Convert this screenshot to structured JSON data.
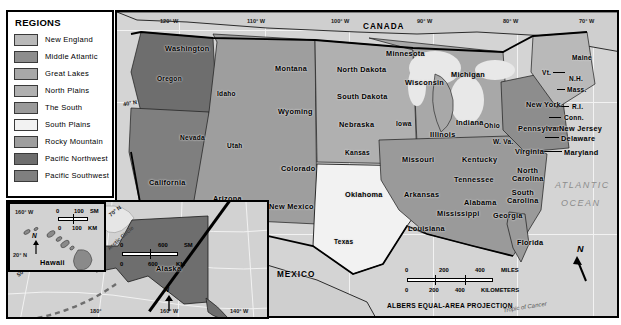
{
  "legend": {
    "title": "REGIONS",
    "items": [
      {
        "label": "New England",
        "color": "#b9b9b9"
      },
      {
        "label": "Middle Atlantic",
        "color": "#8d8d8d"
      },
      {
        "label": "Great Lakes",
        "color": "#a8a8a8"
      },
      {
        "label": "North Plains",
        "color": "#b0b0b0"
      },
      {
        "label": "The South",
        "color": "#9a9a9a"
      },
      {
        "label": "South Plains",
        "color": "#f2f2f2"
      },
      {
        "label": "Rocky Mountain",
        "color": "#9e9e9e"
      },
      {
        "label": "Pacific Northwest",
        "color": "#6e6e6e"
      },
      {
        "label": "Pacific Southwest",
        "color": "#7f7f7f"
      }
    ]
  },
  "map": {
    "countries": [
      "CANADA",
      "MEXICO"
    ],
    "ocean_label_line1": "ATLANTIC",
    "ocean_label_line2": "OCEAN",
    "longitudes": [
      "120° W",
      "110° W",
      "100° W",
      "90° W",
      "80° W",
      "70° W"
    ],
    "latitudes": [
      "40° N",
      "30° N"
    ],
    "tropic_label": "Tropic of Cancer",
    "projection": "ALBERS EQUAL-AREA PROJECTION",
    "compass": "N",
    "scale": {
      "miles_label": "MILES",
      "miles_ticks": [
        "0",
        "200",
        "400"
      ],
      "km_label": "KILOMETERS",
      "km_ticks": [
        "0",
        "200",
        "400"
      ]
    },
    "states": [
      {
        "name": "Washington",
        "x": 48,
        "y": 32,
        "region": "Pacific Northwest"
      },
      {
        "name": "Oregon",
        "x": 40,
        "y": 63,
        "region": "Pacific Northwest"
      },
      {
        "name": "Idaho",
        "x": 100,
        "y": 78,
        "region": "Rocky Mountain"
      },
      {
        "name": "Montana",
        "x": 158,
        "y": 52,
        "region": "Rocky Mountain"
      },
      {
        "name": "Wyoming",
        "x": 161,
        "y": 95,
        "region": "Rocky Mountain"
      },
      {
        "name": "Nevada",
        "x": 63,
        "y": 122,
        "region": "Pacific Southwest"
      },
      {
        "name": "Utah",
        "x": 110,
        "y": 130,
        "region": "Rocky Mountain"
      },
      {
        "name": "Colorado",
        "x": 164,
        "y": 152,
        "region": "Rocky Mountain"
      },
      {
        "name": "California",
        "x": 32,
        "y": 166,
        "region": "Pacific Southwest"
      },
      {
        "name": "Arizona",
        "x": 96,
        "y": 182,
        "region": "Rocky Mountain"
      },
      {
        "name": "New Mexico",
        "x": 152,
        "y": 190,
        "region": "Rocky Mountain"
      },
      {
        "name": "North Dakota",
        "x": 220,
        "y": 53,
        "region": "North Plains"
      },
      {
        "name": "South Dakota",
        "x": 220,
        "y": 80,
        "region": "North Plains"
      },
      {
        "name": "Nebraska",
        "x": 222,
        "y": 108,
        "region": "North Plains"
      },
      {
        "name": "Kansas",
        "x": 228,
        "y": 137,
        "region": "North Plains"
      },
      {
        "name": "Oklahoma",
        "x": 228,
        "y": 178,
        "region": "South Plains"
      },
      {
        "name": "Texas",
        "x": 217,
        "y": 226,
        "region": "South Plains"
      },
      {
        "name": "Minnesota",
        "x": 269,
        "y": 37,
        "region": "Great Lakes"
      },
      {
        "name": "Wisconsin",
        "x": 288,
        "y": 66,
        "region": "Great Lakes"
      },
      {
        "name": "Iowa",
        "x": 279,
        "y": 108,
        "region": "North Plains"
      },
      {
        "name": "Missouri",
        "x": 285,
        "y": 143,
        "region": "The South"
      },
      {
        "name": "Arkansas",
        "x": 287,
        "y": 178,
        "region": "The South"
      },
      {
        "name": "Louisiana",
        "x": 291,
        "y": 212,
        "region": "The South"
      },
      {
        "name": "Mississippi",
        "x": 320,
        "y": 197,
        "region": "The South"
      },
      {
        "name": "Alabama",
        "x": 347,
        "y": 186,
        "region": "The South"
      },
      {
        "name": "Tennessee",
        "x": 337,
        "y": 163,
        "region": "The South"
      },
      {
        "name": "Kentucky",
        "x": 345,
        "y": 143,
        "region": "The South"
      },
      {
        "name": "Illinois",
        "x": 313,
        "y": 118,
        "region": "Great Lakes"
      },
      {
        "name": "Indiana",
        "x": 339,
        "y": 106,
        "region": "Great Lakes"
      },
      {
        "name": "Michigan",
        "x": 334,
        "y": 58,
        "region": "Great Lakes"
      },
      {
        "name": "Ohio",
        "x": 367,
        "y": 110,
        "region": "Great Lakes"
      },
      {
        "name": "Georgia",
        "x": 376,
        "y": 199,
        "region": "The South"
      },
      {
        "name": "Florida",
        "x": 400,
        "y": 226,
        "region": "The South"
      },
      {
        "name": "South\nCarolina",
        "x": 390,
        "y": 177,
        "region": "The South"
      },
      {
        "name": "North\nCarolina",
        "x": 395,
        "y": 155,
        "region": "The South"
      },
      {
        "name": "Virginia",
        "x": 398,
        "y": 135,
        "region": "The South"
      },
      {
        "name": "W. Va.",
        "x": 376,
        "y": 126,
        "region": "The South"
      },
      {
        "name": "Pennsylvania",
        "x": 401,
        "y": 112,
        "region": "Middle Atlantic"
      },
      {
        "name": "New York",
        "x": 409,
        "y": 88,
        "region": "Middle Atlantic"
      },
      {
        "name": "Maine",
        "x": 455,
        "y": 42,
        "region": "New England"
      },
      {
        "name": "Vt.",
        "x": 425,
        "y": 57,
        "region": "New England"
      },
      {
        "name": "N.H.",
        "x": 452,
        "y": 63,
        "region": "New England"
      },
      {
        "name": "Mass.",
        "x": 450,
        "y": 74,
        "region": "New England"
      },
      {
        "name": "R.I.",
        "x": 455,
        "y": 91,
        "region": "New England"
      },
      {
        "name": "Conn.",
        "x": 447,
        "y": 102,
        "region": "New England"
      },
      {
        "name": "New Jersey",
        "x": 442,
        "y": 112,
        "region": "Middle Atlantic"
      },
      {
        "name": "Delaware",
        "x": 444,
        "y": 122,
        "region": "Middle Atlantic"
      },
      {
        "name": "Maryland",
        "x": 447,
        "y": 136,
        "region": "Middle Atlantic"
      }
    ]
  },
  "inset_alaska": {
    "title": "Alaska",
    "arctic_circle": "Arctic  Circle",
    "coords": [
      "70° N",
      "60° N",
      "50° N",
      "180°",
      "160° W",
      "140° W",
      "30° N",
      "40° N"
    ],
    "compass": "N",
    "scale": {
      "miles_label": "SM",
      "miles_ticks": [
        "0",
        "600"
      ],
      "km_label": "KM",
      "km_ticks": [
        "0",
        "600"
      ]
    }
  },
  "inset_hawaii": {
    "title": "Hawaii",
    "coords": [
      "160° W",
      "20° N"
    ],
    "compass": "N",
    "scale": {
      "miles_label": "SM",
      "miles_ticks": [
        "0",
        "100"
      ],
      "km_label": "KM",
      "km_ticks": [
        "0",
        "100"
      ]
    }
  }
}
